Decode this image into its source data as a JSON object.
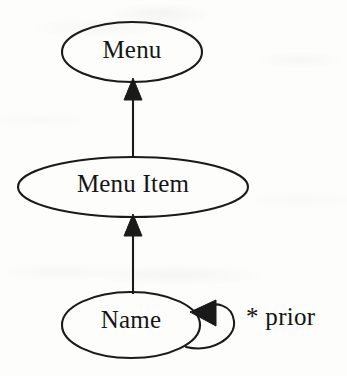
{
  "diagram": {
    "type": "directed-graph",
    "stroke_color": "#1a1a1a",
    "background_color": "#fdfdfc",
    "nodes": [
      {
        "id": "menu",
        "label": "Menu",
        "shape": "ellipse",
        "cx": 132,
        "cy": 52,
        "rx": 70,
        "ry": 30
      },
      {
        "id": "menu-item",
        "label": "Menu Item",
        "shape": "ellipse",
        "cx": 133,
        "cy": 187,
        "rx": 115,
        "ry": 30
      },
      {
        "id": "name",
        "label": "Name",
        "shape": "ellipse",
        "cx": 131,
        "cy": 325,
        "rx": 69,
        "ry": 33
      }
    ],
    "edges": [
      {
        "id": "edge-menu-item-to-menu",
        "from": "menu-item",
        "to": "menu",
        "label": "",
        "arrowhead": "solid-triangle",
        "direction": "up"
      },
      {
        "id": "edge-name-to-menu-item",
        "from": "name",
        "to": "menu-item",
        "label": "",
        "arrowhead": "solid-triangle",
        "direction": "up"
      },
      {
        "id": "edge-name-self-loop",
        "from": "name",
        "to": "name",
        "label": "* prior",
        "arrowhead": "solid-triangle",
        "direction": "left"
      }
    ]
  }
}
